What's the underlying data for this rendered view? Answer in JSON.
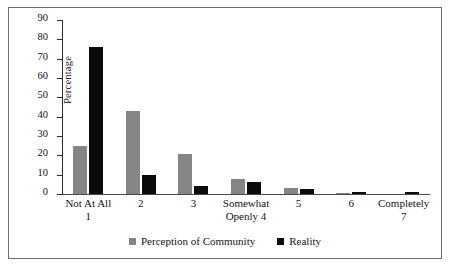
{
  "chart_data": {
    "type": "bar",
    "title": "",
    "subtitle": "",
    "xlabel": "",
    "ylabel": "Percentage",
    "ylim": [
      0,
      90
    ],
    "ytick_values": [
      0,
      10,
      20,
      30,
      40,
      50,
      60,
      70,
      80,
      90
    ],
    "ytick_labels": [
      "0",
      "10",
      "20",
      "30",
      "40",
      "50",
      "60",
      "70",
      "80",
      "90"
    ],
    "grid": false,
    "legend_position": "bottom-center",
    "categories": [
      "Not At All\n1",
      "2",
      "3",
      "Somewhat\nOpenly 4",
      "5",
      "6",
      "Completely\n7"
    ],
    "category_lines": [
      [
        "Not At All",
        "1"
      ],
      [
        "2",
        ""
      ],
      [
        "3",
        ""
      ],
      [
        "Somewhat",
        "Openly 4"
      ],
      [
        "5",
        ""
      ],
      [
        "6",
        ""
      ],
      [
        "Completely",
        "7"
      ]
    ],
    "series": [
      {
        "name": "Perception of Community",
        "color": "#858585",
        "values": [
          25,
          43,
          20.5,
          8,
          3,
          0.5,
          0
        ]
      },
      {
        "name": "Reality",
        "color": "#0b0b0b",
        "values": [
          76,
          10,
          4,
          6,
          2.5,
          1.2,
          1.2
        ]
      }
    ]
  },
  "legend": {
    "items": [
      {
        "label": "Perception of Community",
        "color": "#858585"
      },
      {
        "label": "Reality",
        "color": "#0b0b0b"
      }
    ]
  }
}
